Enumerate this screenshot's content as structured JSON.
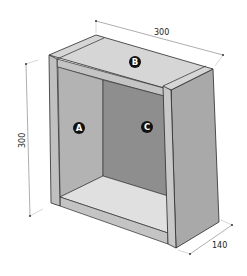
{
  "diagram": {
    "type": "isometric-cabinet-drawing",
    "dimensions": {
      "width": "300",
      "height": "300",
      "depth": "140"
    },
    "panels": {
      "A": "A",
      "B": "B",
      "C": "C"
    },
    "colors": {
      "outline": "#2a2a2a",
      "side_panel_inner": "#b3b3b3",
      "back_panel": "#8e8e8e",
      "top_panel": "#d6d6d6",
      "floor_panel": "#e0e0e0",
      "edge_front": "#c4c4c4",
      "right_side": "#a9a9a9",
      "dimension_line": "#777777",
      "badge_fill": "#111111",
      "badge_text": "#ffffff"
    }
  }
}
